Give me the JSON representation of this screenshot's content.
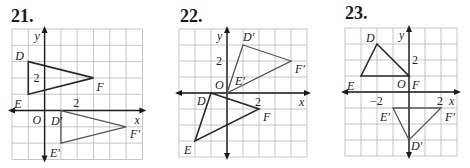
{
  "problems": [
    {
      "number": "21.",
      "number_pos": [
        11,
        23
      ],
      "grid": {
        "left": 12,
        "top": 29,
        "cell": 16.3,
        "cols": 8,
        "rows": 8,
        "origin_col": 2,
        "origin_row": 5
      },
      "axis_labels": {
        "x": "x",
        "y": "y",
        "origin": "O"
      },
      "ticks": [
        {
          "text": "2",
          "axis": "y",
          "value": 2
        },
        {
          "text": "2",
          "axis": "x",
          "value": 2
        }
      ],
      "original": {
        "vertices": [
          {
            "name": "D",
            "x": -1,
            "y": 3,
            "label_dx": -13,
            "label_dy": -2
          },
          {
            "name": "E",
            "x": -1,
            "y": 1,
            "label_dx": -14,
            "label_dy": 14
          },
          {
            "name": "F",
            "x": 3,
            "y": 2,
            "label_dx": 3,
            "label_dy": 13
          }
        ]
      },
      "image": {
        "vertices": [
          {
            "name": "D'",
            "x": 1,
            "y": 0,
            "label_dx": -10,
            "label_dy": 14
          },
          {
            "name": "E'",
            "x": 1,
            "y": -2,
            "label_dx": -11,
            "label_dy": 14
          },
          {
            "name": "F'",
            "x": 5,
            "y": -1,
            "label_dx": 4,
            "label_dy": 11
          }
        ]
      }
    },
    {
      "number": "22.",
      "number_pos": [
        180,
        23
      ],
      "grid": {
        "left": 179,
        "top": 29,
        "cell": 16,
        "cols": 8,
        "rows": 8,
        "origin_col": 3,
        "origin_row": 4
      },
      "axis_labels": {
        "x": "x",
        "y": "y",
        "origin": "O"
      },
      "ticks": [
        {
          "text": "2",
          "axis": "y",
          "value": 2
        },
        {
          "text": "2",
          "axis": "x",
          "value": 2
        }
      ],
      "original": {
        "vertices": [
          {
            "name": "D",
            "x": -1,
            "y": 0,
            "label_dx": -14,
            "label_dy": 12
          },
          {
            "name": "E",
            "x": -2,
            "y": -3,
            "label_dx": -11,
            "label_dy": 13
          },
          {
            "name": "F",
            "x": 2,
            "y": -1,
            "label_dx": 4,
            "label_dy": 12
          }
        ]
      },
      "image": {
        "vertices": [
          {
            "name": "D'",
            "x": 1,
            "y": 3,
            "label_dx": 0,
            "label_dy": -4
          },
          {
            "name": "E'",
            "x": 0,
            "y": 0,
            "label_dx": 8,
            "label_dy": -8
          },
          {
            "name": "F'",
            "x": 4,
            "y": 2,
            "label_dx": 4,
            "label_dy": 12
          }
        ]
      }
    },
    {
      "number": "23.",
      "number_pos": [
        345,
        20
      ],
      "grid": {
        "left": 345,
        "top": 28,
        "cell": 16,
        "cols": 7,
        "rows": 8,
        "origin_col": 4,
        "origin_row": 4
      },
      "axis_labels": {
        "x": "x",
        "y": "y",
        "origin": "O"
      },
      "ticks": [
        {
          "text": "2",
          "axis": "y",
          "value": 2
        },
        {
          "text": "−2",
          "axis": "x",
          "value": -2
        },
        {
          "text": "2",
          "axis": "x",
          "value": 2
        }
      ],
      "original": {
        "vertices": [
          {
            "name": "D",
            "x": -2,
            "y": 3,
            "label_dx": -11,
            "label_dy": -2
          },
          {
            "name": "E",
            "x": -3,
            "y": 1,
            "label_dx": -14,
            "label_dy": 14
          },
          {
            "name": "F",
            "x": 0,
            "y": 1,
            "label_dx": 3,
            "label_dy": 13
          }
        ]
      },
      "image": {
        "vertices": [
          {
            "name": "D'",
            "x": 0,
            "y": -3,
            "label_dx": 2,
            "label_dy": 10
          },
          {
            "name": "E'",
            "x": -1,
            "y": -1,
            "label_dx": -13,
            "label_dy": 13
          },
          {
            "name": "F'",
            "x": 2,
            "y": -1,
            "label_dx": 4,
            "label_dy": 13
          }
        ]
      }
    }
  ]
}
